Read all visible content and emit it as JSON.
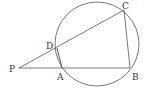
{
  "diagram": {
    "type": "geometry",
    "circle": {
      "cx": 97,
      "cy": 44,
      "r": 42
    },
    "points": [
      {
        "name": "P",
        "x": 19,
        "y": 68,
        "lx": 9,
        "ly": 72
      },
      {
        "name": "A",
        "x": 62,
        "y": 68,
        "lx": 57,
        "ly": 79
      },
      {
        "name": "B",
        "x": 130,
        "y": 68,
        "lx": 132,
        "ly": 79
      },
      {
        "name": "C",
        "x": 124,
        "y": 10,
        "lx": 122,
        "ly": 9
      },
      {
        "name": "D",
        "x": 57,
        "y": 48,
        "lx": 46,
        "ly": 49
      }
    ],
    "segments": [
      [
        "P",
        "B"
      ],
      [
        "P",
        "C"
      ],
      [
        "C",
        "B"
      ],
      [
        "D",
        "A"
      ]
    ]
  },
  "labels": {
    "P": "P",
    "A": "A",
    "B": "B",
    "C": "C",
    "D": "D"
  }
}
